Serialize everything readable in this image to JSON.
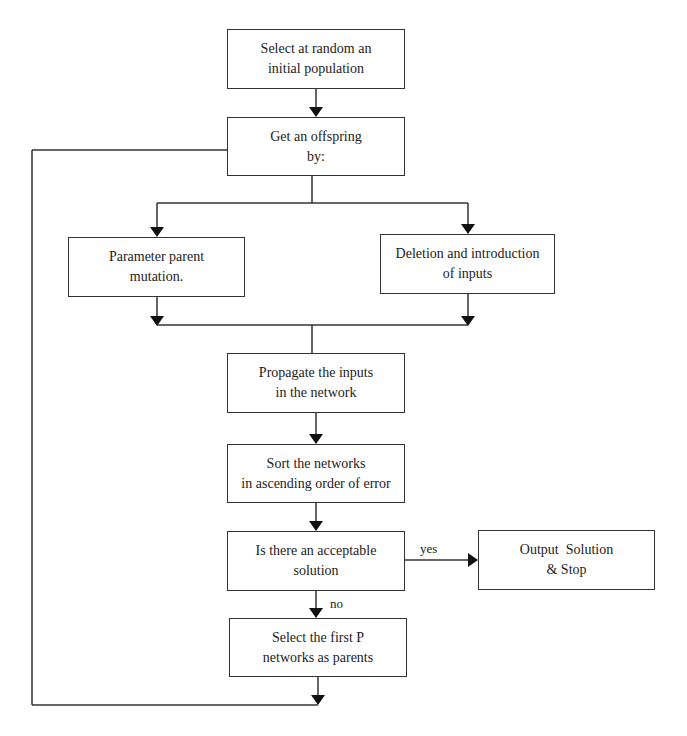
{
  "diagram": {
    "type": "flowchart",
    "nodes": [
      {
        "id": "init",
        "lines": [
          "Select at random an",
          "initial population"
        ]
      },
      {
        "id": "offspring",
        "lines": [
          "Get an offspring",
          "by:"
        ]
      },
      {
        "id": "mutation",
        "lines": [
          "Parameter parent",
          "mutation."
        ]
      },
      {
        "id": "deletion",
        "lines": [
          "Deletion and introduction",
          "of inputs"
        ]
      },
      {
        "id": "propagate",
        "lines": [
          "Propagate the inputs",
          "in the network"
        ]
      },
      {
        "id": "sort",
        "lines": [
          "Sort the networks",
          "in ascending order of error"
        ]
      },
      {
        "id": "decision",
        "lines": [
          "Is there an acceptable",
          "solution"
        ]
      },
      {
        "id": "output",
        "lines": [
          "Output  Solution",
          "& Stop"
        ]
      },
      {
        "id": "select",
        "lines": [
          "Select the first P",
          "networks as parents"
        ]
      }
    ],
    "edge_labels": {
      "yes": "yes",
      "no": "no"
    },
    "edges": [
      {
        "from": "init",
        "to": "offspring"
      },
      {
        "from": "offspring",
        "to": "mutation"
      },
      {
        "from": "offspring",
        "to": "deletion"
      },
      {
        "from": "mutation",
        "to": "propagate"
      },
      {
        "from": "deletion",
        "to": "propagate"
      },
      {
        "from": "propagate",
        "to": "sort"
      },
      {
        "from": "sort",
        "to": "decision"
      },
      {
        "from": "decision",
        "to": "output",
        "label": "yes"
      },
      {
        "from": "decision",
        "to": "select",
        "label": "no"
      },
      {
        "from": "select",
        "to": "offspring",
        "label": "loop"
      }
    ]
  }
}
